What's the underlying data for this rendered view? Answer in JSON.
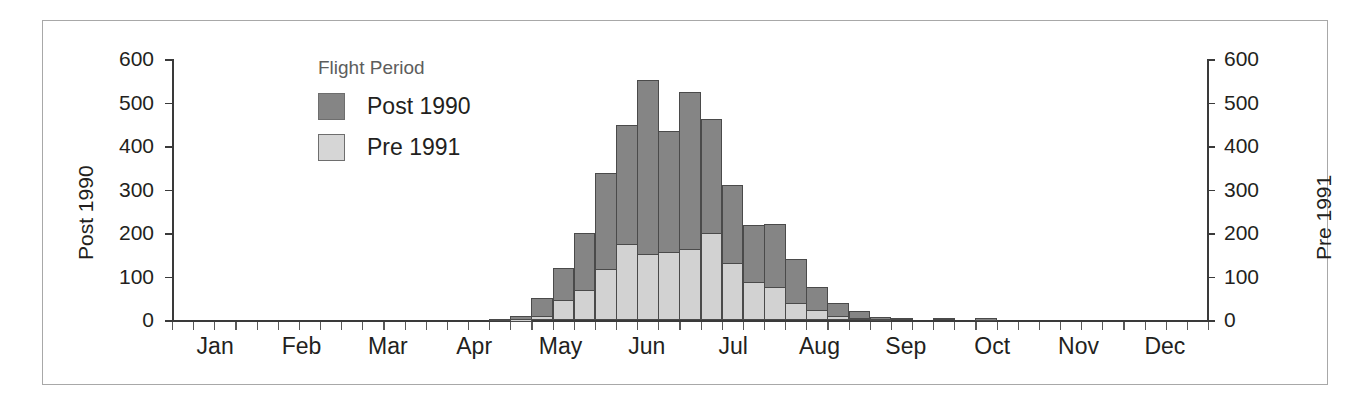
{
  "chart_data": {
    "type": "bar",
    "title": "",
    "subtitle": "",
    "xlabel": "",
    "ylabel_left": "Post 1990",
    "ylabel_right": "Pre 1991",
    "ylim": [
      0,
      600
    ],
    "yticks": [
      0,
      100,
      200,
      300,
      400,
      500,
      600
    ],
    "ytick_labels_left": [
      "0",
      "100",
      "200",
      "300",
      "400",
      "500",
      "600"
    ],
    "ytick_labels_right": [
      "0",
      "100",
      "200",
      "300",
      "400",
      "500",
      "600"
    ],
    "grid": false,
    "bar_style": "overlaid",
    "month_labels": [
      "Jan",
      "Feb",
      "Mar",
      "Apr",
      "May",
      "Jun",
      "Jul",
      "Aug",
      "Sep",
      "Oct",
      "Nov",
      "Dec"
    ],
    "x_bin_description": "weekly flight-period bins across the calendar year",
    "n_bins": 49,
    "legend": {
      "title": "Flight Period",
      "position": "upper-left-inside",
      "entries": [
        {
          "name": "Post 1990",
          "color": "#858585"
        },
        {
          "name": "Pre 1991",
          "color": "#d2d2d2"
        }
      ]
    },
    "series": [
      {
        "name": "Post 1990",
        "color": "#858585",
        "values": [
          0,
          0,
          0,
          0,
          0,
          0,
          0,
          0,
          0,
          0,
          0,
          0,
          0,
          0,
          0,
          3,
          10,
          50,
          120,
          200,
          337,
          448,
          552,
          435,
          523,
          461,
          310,
          218,
          220,
          140,
          75,
          40,
          20,
          8,
          5,
          0,
          5,
          0,
          4,
          0,
          0,
          0,
          0,
          0,
          0,
          0,
          0,
          0,
          0
        ]
      },
      {
        "name": "Pre 1991",
        "color": "#d2d2d2",
        "values": [
          0,
          0,
          0,
          0,
          0,
          0,
          0,
          0,
          0,
          0,
          0,
          0,
          0,
          0,
          0,
          0,
          2,
          10,
          45,
          68,
          118,
          175,
          152,
          157,
          163,
          200,
          130,
          88,
          75,
          38,
          22,
          10,
          5,
          3,
          0,
          0,
          0,
          0,
          0,
          0,
          0,
          0,
          0,
          0,
          0,
          0,
          0,
          0,
          0
        ]
      }
    ]
  },
  "axes": {
    "left_title": "Post 1990",
    "right_title": "Pre 1991"
  }
}
